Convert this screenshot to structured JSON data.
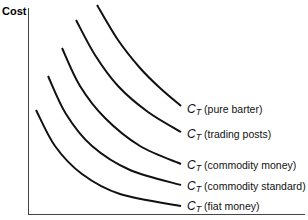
{
  "chart_data": {
    "type": "line",
    "title": "",
    "xlabel": "",
    "ylabel": "Cost",
    "grid": false,
    "legend_position": "inline-right",
    "axis": {
      "x_ticks": [],
      "y_ticks": []
    },
    "series": [
      {
        "name": "C_T (pure barter)",
        "symbol": "C",
        "subscript": "T",
        "desc": "(pure barter)",
        "points": [
          [
            97,
            5
          ],
          [
            118,
            40
          ],
          [
            140,
            68
          ],
          [
            160,
            88
          ],
          [
            181,
            106
          ]
        ]
      },
      {
        "name": "C_T (trading posts)",
        "symbol": "C",
        "subscript": "T",
        "desc": "(trading posts)",
        "points": [
          [
            76,
            20
          ],
          [
            95,
            55
          ],
          [
            118,
            86
          ],
          [
            148,
            112
          ],
          [
            181,
            132
          ]
        ]
      },
      {
        "name": "C_T (commodity money)",
        "symbol": "C",
        "subscript": "T",
        "desc": "(commodity money)",
        "points": [
          [
            62,
            48
          ],
          [
            80,
            86
          ],
          [
            105,
            118
          ],
          [
            140,
            146
          ],
          [
            181,
            164
          ]
        ]
      },
      {
        "name": "C_T (commodity standard)",
        "symbol": "C",
        "subscript": "T",
        "desc": "(commodity standard)",
        "points": [
          [
            48,
            76
          ],
          [
            66,
            114
          ],
          [
            92,
            146
          ],
          [
            130,
            170
          ],
          [
            181,
            185
          ]
        ]
      },
      {
        "name": "C_T (fiat money)",
        "symbol": "C",
        "subscript": "T",
        "desc": "(fiat money)",
        "points": [
          [
            36,
            110
          ],
          [
            55,
            146
          ],
          [
            82,
            174
          ],
          [
            120,
            194
          ],
          [
            181,
            206
          ]
        ]
      }
    ],
    "label_y": [
      110,
      135,
      166,
      187,
      207
    ]
  },
  "axes": {
    "ylabel": "Cost"
  }
}
